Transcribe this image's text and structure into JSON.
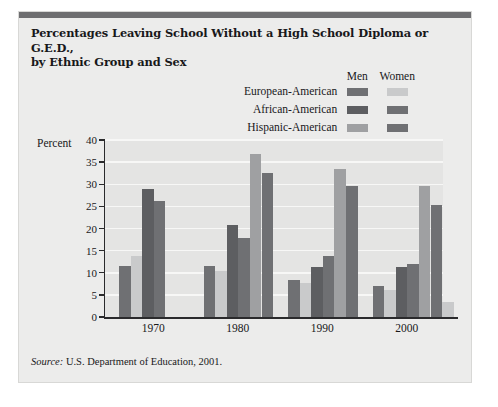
{
  "figure": {
    "title_line1": "Percentages Leaving School Without a High School Diploma or G.E.D.,",
    "title_line2": "by Ethnic Group and Sex",
    "source_prefix": "Source:",
    "source_text": "U.S. Department of Education, 2001."
  },
  "legend": {
    "col_men": "Men",
    "col_women": "Women",
    "rows": [
      {
        "label": "European-American",
        "men_color": "#6f7073",
        "women_color": "#c9cacb"
      },
      {
        "label": "African-American",
        "men_color": "#5d5e61",
        "women_color": "#6f7073"
      },
      {
        "label": "Hispanic-American",
        "men_color": "#9fa0a2",
        "women_color": "#6f7073"
      },
      {
        "label": "Asian-American",
        "men_color": "#c9cacb",
        "women_color": null
      }
    ]
  },
  "chart_data": {
    "type": "bar",
    "title": "Percentages Leaving School Without a High School Diploma or G.E.D., by Ethnic Group and Sex",
    "xlabel": "",
    "ylabel": "Percent",
    "ylim": [
      0,
      40
    ],
    "yticks": [
      0,
      5,
      10,
      15,
      20,
      25,
      30,
      35,
      40
    ],
    "grid": true,
    "legend_position": "top-right",
    "categories": [
      "1970",
      "1980",
      "1990",
      "2000"
    ],
    "series": [
      {
        "name": "European-American Men",
        "color": "#6f7073",
        "values": [
          11.6,
          11.6,
          8.4,
          6.9
        ]
      },
      {
        "name": "European-American Women",
        "color": "#c9cacb",
        "values": [
          13.8,
          10.3,
          7.8,
          6.2
        ]
      },
      {
        "name": "African-American Men",
        "color": "#5d5e61",
        "values": [
          28.9,
          20.7,
          11.4,
          11.2
        ]
      },
      {
        "name": "African-American Women",
        "color": "#6f7073",
        "values": [
          26.3,
          17.8,
          13.8,
          12.0
        ]
      },
      {
        "name": "Hispanic-American Men",
        "color": "#9fa0a2",
        "values": [
          null,
          36.9,
          33.5,
          29.5
        ]
      },
      {
        "name": "Hispanic-American Women",
        "color": "#6f7073",
        "values": [
          null,
          32.6,
          29.5,
          25.3
        ]
      },
      {
        "name": "Asian-American Men",
        "color": "#c9cacb",
        "values": [
          null,
          null,
          null,
          3.5
        ]
      }
    ]
  }
}
